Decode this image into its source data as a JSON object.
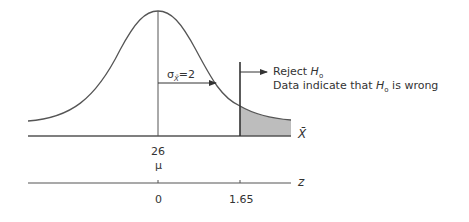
{
  "diagram": {
    "type": "normal-distribution-hypothesis-test",
    "sigma_label": "σ",
    "sigma_sub": "X̄",
    "sigma_value": "=2",
    "reject_line1_prefix": "Reject ",
    "reject_h": "H",
    "reject_sub": "o",
    "reject_line2_prefix": "Data indicate that ",
    "reject_line2_h": "H",
    "reject_line2_sub": "o",
    "reject_line2_suffix": " is wrong",
    "xbar_axis_label": "X̄",
    "mean_value": "26",
    "mu_label": "μ",
    "z_axis_label": "z",
    "z_ticks": [
      "0",
      "1.65"
    ],
    "colors": {
      "line": "#555555",
      "shade": "#bdbdbd"
    }
  }
}
